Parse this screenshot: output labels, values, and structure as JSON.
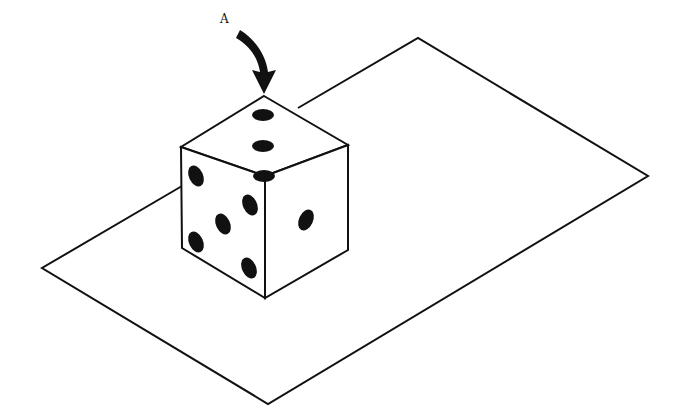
{
  "diagram": {
    "label": {
      "text": "A",
      "x": 222,
      "y": 22
    },
    "colors": {
      "line": "#111111",
      "background": "#ffffff",
      "pip": "#111111"
    },
    "plane": {
      "points": [
        [
          418,
          38
        ],
        [
          648,
          176
        ],
        [
          268,
          404
        ],
        [
          42,
          268
        ]
      ]
    },
    "cube": {
      "top_vertex": [
        264,
        96
      ],
      "faces": {
        "top": {
          "pips": 3
        },
        "left": {
          "pips": 4
        },
        "right": {
          "pips": 1
        }
      }
    }
  }
}
